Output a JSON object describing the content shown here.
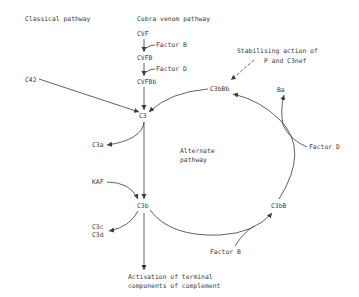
{
  "diagram": {
    "headings": {
      "classical": "Classical pathway",
      "cobra": "Cobra venom pathway"
    },
    "nodes": {
      "cvf": "CVF",
      "cvfb": "CVFB",
      "cvfbb": "CVFBb",
      "c42": "C42",
      "c3": "C3",
      "c3a": "C3a",
      "kaf": "KAF",
      "c3b": "C3b",
      "c3c": "C3c",
      "c3d": "C3d",
      "c3bbb": "C3bBb",
      "ba": "Ba",
      "c3bb": "C3bB",
      "alternate_line1": "Alternate",
      "alternate_line2": "pathway",
      "activation_line1": "Activation of terminal",
      "activation_line2": "components of complement"
    },
    "factors": {
      "factor_b_top": "Factor B",
      "factor_d_top": "Factor D",
      "factor_d_right": "Factor D",
      "factor_b_bottom": "Factor B"
    },
    "annotations": {
      "stabilising_line1": "Stabilising action of",
      "stabilising_line2": "P and C3nef"
    },
    "colors": {
      "ink": "#3a3a3a",
      "background": "#ffffff"
    }
  }
}
